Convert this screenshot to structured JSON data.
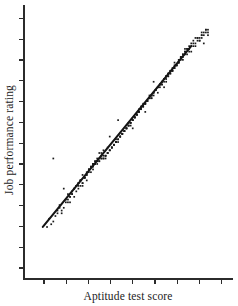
{
  "chart_data": {
    "type": "scatter",
    "title": "",
    "xlabel": "Aptitude test score",
    "ylabel": "Job performance rating",
    "xlim": [
      0,
      100
    ],
    "ylim": [
      0,
      100
    ],
    "grid": false,
    "legend": null,
    "annotations": [],
    "axis": {
      "x_tick_count": 9,
      "y_tick_count": 13,
      "x_tick_labels": [],
      "y_tick_labels": [],
      "ticks_direction": "outward",
      "spines": [
        "left",
        "bottom"
      ]
    },
    "trendline": {
      "name": "regression line",
      "x": [
        9,
        80
      ],
      "y": [
        19,
        85
      ],
      "color": "#141414"
    },
    "series": [
      {
        "name": "observations",
        "marker": "square",
        "color": "#1a1a1a",
        "x": [
          14,
          30,
          45,
          62,
          71,
          77,
          83,
          52,
          38,
          24,
          67,
          58,
          41,
          33,
          75,
          86,
          19,
          48,
          64,
          28,
          55,
          73,
          36,
          80,
          22,
          60,
          44,
          69,
          31,
          50,
          85,
          17,
          57,
          40,
          76,
          26,
          66,
          35,
          81,
          53,
          12,
          47,
          72,
          29,
          61,
          88,
          43,
          34,
          78,
          56,
          21,
          68,
          39,
          84,
          25,
          59,
          46,
          74,
          32,
          65,
          16,
          51,
          79,
          37,
          70,
          27,
          54,
          87,
          42,
          63,
          23,
          49,
          82,
          30,
          58,
          13,
          71,
          44,
          66,
          36,
          52,
          77,
          20,
          61,
          47,
          85,
          33,
          55,
          73,
          28,
          64,
          41,
          80,
          18,
          57,
          69,
          38,
          50,
          76,
          31,
          62,
          45,
          83,
          24,
          68,
          53,
          15,
          72,
          34,
          59,
          48,
          79,
          26,
          65,
          40,
          56,
          86,
          29,
          74,
          43,
          67,
          35,
          51,
          81,
          22,
          60,
          46,
          75,
          32,
          70,
          17,
          54,
          88,
          39,
          63,
          27,
          58,
          44,
          78,
          49,
          11,
          66,
          37,
          84,
          25,
          52,
          71,
          30,
          61,
          42,
          87,
          36,
          55,
          76,
          23,
          68,
          47,
          33,
          73,
          57,
          19,
          64,
          41,
          82,
          28,
          50,
          79,
          34,
          62,
          45,
          69,
          21,
          56,
          85,
          38,
          74,
          31,
          53,
          67,
          26,
          48,
          77,
          43,
          59,
          16,
          70,
          35,
          81,
          29,
          65,
          51,
          40,
          86,
          24,
          72,
          46,
          60,
          32,
          54,
          75,
          20,
          63,
          37,
          83,
          27,
          57,
          44,
          78,
          33,
          68,
          49,
          14,
          61,
          52,
          88,
          39,
          71,
          25,
          58,
          42,
          66,
          30,
          80,
          47,
          36,
          55,
          74,
          22,
          64,
          43,
          69,
          34,
          50,
          84,
          28,
          59,
          45,
          76,
          18,
          62,
          38,
          73,
          51,
          31,
          67,
          41,
          87,
          26,
          56,
          48,
          79,
          35,
          60,
          23,
          70,
          44,
          53,
          82,
          29,
          65,
          40,
          57,
          77,
          33,
          46,
          68,
          21,
          61,
          37,
          85,
          49,
          27,
          72,
          42,
          54,
          75,
          32,
          66,
          39,
          58
        ],
        "y": [
          44,
          36,
          58,
          72,
          76,
          84,
          88,
          55,
          47,
          30,
          70,
          61,
          52,
          42,
          80,
          86,
          33,
          54,
          68,
          38,
          62,
          78,
          46,
          83,
          28,
          66,
          50,
          74,
          40,
          57,
          90,
          26,
          64,
          48,
          81,
          35,
          71,
          44,
          85,
          59,
          22,
          53,
          77,
          37,
          67,
          89,
          49,
          43,
          82,
          63,
          31,
          73,
          45,
          87,
          34,
          65,
          52,
          79,
          41,
          70,
          25,
          56,
          84,
          46,
          75,
          36,
          60,
          91,
          48,
          69,
          32,
          55,
          86,
          39,
          64,
          20,
          76,
          51,
          72,
          44,
          58,
          82,
          29,
          66,
          53,
          88,
          42,
          61,
          78,
          35,
          70,
          47,
          85,
          24,
          63,
          74,
          45,
          56,
          80,
          40,
          68,
          50,
          87,
          33,
          72,
          59,
          23,
          77,
          43,
          65,
          54,
          83,
          34,
          71,
          46,
          62,
          89,
          37,
          79,
          49,
          73,
          42,
          57,
          86,
          30,
          67,
          52,
          81,
          41,
          75,
          27,
          60,
          90,
          45,
          69,
          36,
          64,
          50,
          84,
          55,
          19,
          71,
          44,
          88,
          32,
          58,
          76,
          38,
          66,
          48,
          91,
          43,
          61,
          82,
          31,
          74,
          53,
          40,
          78,
          63,
          26,
          70,
          47,
          85,
          34,
          56,
          84,
          42,
          67,
          51,
          75,
          29,
          62,
          89,
          44,
          80,
          39,
          59,
          72,
          35,
          54,
          83,
          49,
          65,
          24,
          76,
          43,
          87,
          37,
          71,
          57,
          46,
          90,
          33,
          78,
          52,
          66,
          41,
          60,
          81,
          28,
          69,
          45,
          88,
          36,
          63,
          50,
          84,
          42,
          74,
          55,
          21,
          67,
          58,
          91,
          44,
          77,
          34,
          64,
          48,
          72,
          38,
          86,
          53,
          43,
          61,
          79,
          30,
          70,
          49,
          75,
          42,
          56,
          87,
          35,
          65,
          51,
          82,
          25,
          68,
          44,
          78,
          57,
          40,
          73,
          47,
          90,
          33,
          62,
          54,
          85,
          43,
          66,
          31,
          76,
          50,
          59,
          88,
          37,
          71,
          46,
          63,
          83,
          41,
          52,
          74,
          28,
          67,
          44,
          89,
          55,
          34,
          79,
          48,
          60,
          81,
          39,
          72,
          45,
          64
        ]
      }
    ]
  },
  "labels": {
    "x_axis": "Aptitude test score",
    "y_axis": "Job performance rating"
  },
  "colors": {
    "point": "#1a1a1a",
    "line": "#141414",
    "axis": "#2b2b2b",
    "background": "#ffffff"
  }
}
